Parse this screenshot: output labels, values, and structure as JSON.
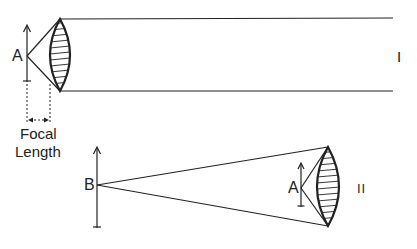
{
  "diagram": {
    "type": "optics-lens-ray-diagram",
    "panels": [
      {
        "id": "I",
        "label": "I",
        "object_label": "A",
        "description": "Object A at focal point of lens produces parallel beam"
      },
      {
        "id": "II",
        "label": "II",
        "object_label": "A",
        "source_label": "B",
        "description": "Distant object B focused by lens; A located near lens"
      }
    ],
    "annotation": {
      "line1": "Focal",
      "line2": "Length"
    },
    "colors": {
      "ink": "#222222",
      "background": "#ffffff"
    }
  }
}
